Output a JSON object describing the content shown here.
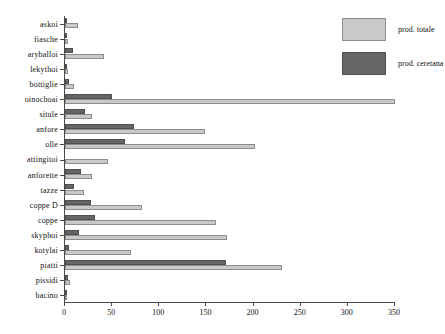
{
  "chart_data": {
    "type": "bar",
    "orientation": "horizontal",
    "title": "",
    "xlabel": "",
    "ylabel": "",
    "xlim": [
      0,
      350
    ],
    "xticks": [
      0,
      50,
      100,
      150,
      200,
      250,
      300,
      350
    ],
    "grid": false,
    "legend_position": "top-right",
    "categories": [
      "askoi",
      "fiasche",
      "aryballoi",
      "lekythoi",
      "bottiglie",
      "oinochoai",
      "situle",
      "anfore",
      "olle",
      "attingitoi",
      "anforette",
      "tazze",
      "coppe D",
      "coppe",
      "skyphoi",
      "kotylai",
      "piatti",
      "pissidi",
      "bacino"
    ],
    "series": [
      {
        "name": "prod. totale",
        "color": "#c9c9c9",
        "values": [
          14,
          3,
          41,
          3,
          10,
          350,
          29,
          148,
          202,
          46,
          29,
          20,
          82,
          160,
          172,
          70,
          230,
          5,
          2
        ]
      },
      {
        "name": "prod. ceretana",
        "color": "#666666",
        "values": [
          2,
          1,
          8,
          1,
          4,
          50,
          21,
          73,
          64,
          0,
          17,
          10,
          28,
          32,
          15,
          4,
          171,
          3,
          1
        ]
      }
    ]
  },
  "legend": {
    "entries": [
      {
        "label": "prod. totale",
        "swatch": "total"
      },
      {
        "label": "prod. ceretana",
        "swatch": "ceretana"
      }
    ]
  },
  "axis": {
    "x_tick_labels": [
      "0",
      "50",
      "100",
      "150",
      "200",
      "250",
      "300",
      "350"
    ]
  }
}
